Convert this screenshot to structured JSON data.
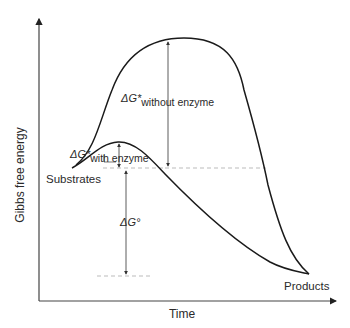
{
  "axes": {
    "y_label": "Gibbs free energy",
    "x_label": "Time"
  },
  "states": {
    "start": "Substrates",
    "end": "Products"
  },
  "annotations": {
    "delta_g_with": {
      "main": "ΔG*",
      "sub": "with enzyme"
    },
    "delta_g_without": {
      "main": "ΔG*",
      "sub": "without enzyme"
    },
    "delta_g_standard": "ΔG°"
  },
  "colors": {
    "curve": "#1a1a1a",
    "axis": "#333333",
    "dashed": "#aaaaaa",
    "text": "#2a2a2a"
  }
}
